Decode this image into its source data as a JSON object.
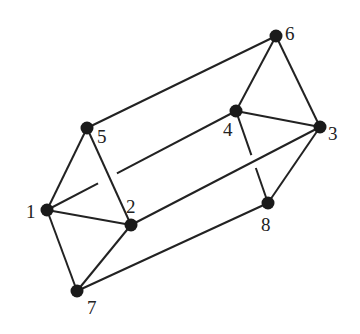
{
  "diagram": {
    "type": "graph",
    "colors": {
      "edge": "#222222",
      "node": "#1a1a1a",
      "background": "#ffffff"
    },
    "nodes": [
      {
        "id": "1",
        "label": "1",
        "x": 47,
        "y": 210,
        "lx": 26,
        "ly": 218
      },
      {
        "id": "2",
        "label": "2",
        "x": 131,
        "y": 225,
        "lx": 126,
        "ly": 213
      },
      {
        "id": "3",
        "label": "3",
        "x": 320,
        "y": 127,
        "lx": 328,
        "ly": 140
      },
      {
        "id": "4",
        "label": "4",
        "x": 236,
        "y": 111,
        "lx": 223,
        "ly": 136
      },
      {
        "id": "5",
        "label": "5",
        "x": 87,
        "y": 128,
        "lx": 97,
        "ly": 143
      },
      {
        "id": "6",
        "label": "6",
        "x": 276,
        "y": 36,
        "lx": 285,
        "ly": 40
      },
      {
        "id": "7",
        "label": "7",
        "x": 77,
        "y": 291,
        "lx": 87,
        "ly": 314
      },
      {
        "id": "8",
        "label": "8",
        "x": 268,
        "y": 203,
        "lx": 261,
        "ly": 231
      }
    ],
    "edges": [
      {
        "from": "5",
        "to": "6"
      },
      {
        "from": "5",
        "to": "1"
      },
      {
        "from": "5",
        "to": "2"
      },
      {
        "from": "1",
        "to": "2"
      },
      {
        "from": "1",
        "to": "7"
      },
      {
        "from": "7",
        "to": "2"
      },
      {
        "from": "2",
        "to": "3"
      },
      {
        "from": "7",
        "to": "8"
      },
      {
        "from": "8",
        "to": "3"
      },
      {
        "from": "6",
        "to": "4"
      },
      {
        "from": "6",
        "to": "3"
      },
      {
        "from": "4",
        "to": "3"
      },
      {
        "from": "1",
        "to": "4",
        "gap": [
          0.27,
          0.37
        ],
        "note": "broken where it passes behind edge 5-2"
      },
      {
        "from": "4",
        "to": "8",
        "gap": [
          0.48,
          0.62
        ],
        "note": "broken where it passes behind edge 2-3"
      }
    ]
  }
}
